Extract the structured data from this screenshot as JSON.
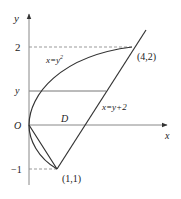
{
  "diagram": {
    "axes": {
      "x_label": "x",
      "y_label": "y",
      "origin_label": "O"
    },
    "ticks": {
      "y_two": "2",
      "y_var": "y",
      "y_neg_one": "−1"
    },
    "curves": {
      "parabola_label": "x=y²",
      "parabola_base": "x=y",
      "parabola_exp": "2",
      "line_label": "x=y+2"
    },
    "region_label": "D",
    "points": {
      "upper": "(4,2)",
      "lower": "(1,1)"
    },
    "colors": {
      "stroke": "#333333",
      "axis": "#888888",
      "dash": "#999999"
    }
  }
}
